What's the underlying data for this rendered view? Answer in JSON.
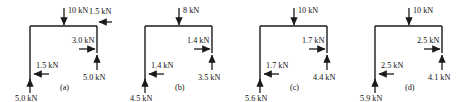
{
  "figure": {
    "title": "",
    "type": "free-body-diagram-set",
    "panel_count": 4,
    "units": "kN",
    "stroke_color": "#1a1a1a"
  },
  "panels": [
    {
      "caption": "(a)",
      "loads": {
        "top_vertical": {
          "label": "10 kN",
          "value": 10.0,
          "direction": "down"
        },
        "top_right_horizontal": {
          "label": "1.5 kN",
          "value": 1.5,
          "direction": "left"
        },
        "mid_right_horizontal": {
          "label": "3.0 kN",
          "value": 3.0,
          "direction": "right"
        },
        "right_vertical": {
          "label": "5.0 kN",
          "value": 5.0,
          "direction": "up"
        },
        "bottom_left_horizontal": {
          "label": "1.5 kN",
          "value": 1.5,
          "direction": "left"
        },
        "bottom_left_vertical": {
          "label": "5.0 kN",
          "value": 5.0,
          "direction": "up"
        }
      }
    },
    {
      "caption": "(b)",
      "loads": {
        "top_vertical": {
          "label": "8 kN",
          "value": 8.0,
          "direction": "down"
        },
        "top_right_horizontal": null,
        "mid_right_horizontal": {
          "label": "1.4 kN",
          "value": 1.4,
          "direction": "right"
        },
        "right_vertical": {
          "label": "3.5 kN",
          "value": 3.5,
          "direction": "up"
        },
        "bottom_left_horizontal": {
          "label": "1.4 kN",
          "value": 1.4,
          "direction": "left"
        },
        "bottom_left_vertical": {
          "label": "4.5 kN",
          "value": 4.5,
          "direction": "up"
        }
      }
    },
    {
      "caption": "(c)",
      "loads": {
        "top_vertical": {
          "label": "10 kN",
          "value": 10.0,
          "direction": "down"
        },
        "top_right_horizontal": null,
        "mid_right_horizontal": {
          "label": "1.7 kN",
          "value": 1.7,
          "direction": "right"
        },
        "right_vertical": {
          "label": "4.4 kN",
          "value": 4.4,
          "direction": "up"
        },
        "bottom_left_horizontal": {
          "label": "1.7 kN",
          "value": 1.7,
          "direction": "left"
        },
        "bottom_left_vertical": {
          "label": "5.6 kN",
          "value": 5.6,
          "direction": "up"
        }
      }
    },
    {
      "caption": "(d)",
      "loads": {
        "top_vertical": {
          "label": "10 kN",
          "value": 10.0,
          "direction": "down"
        },
        "top_right_horizontal": null,
        "mid_right_horizontal": {
          "label": "2.5 kN",
          "value": 2.5,
          "direction": "right"
        },
        "right_vertical": {
          "label": "4.1 kN",
          "value": 4.1,
          "direction": "up"
        },
        "bottom_left_horizontal": {
          "label": "2.5 kN",
          "value": 2.5,
          "direction": "left"
        },
        "bottom_left_vertical": {
          "label": "5.9 kN",
          "value": 5.9,
          "direction": "up"
        }
      }
    }
  ]
}
